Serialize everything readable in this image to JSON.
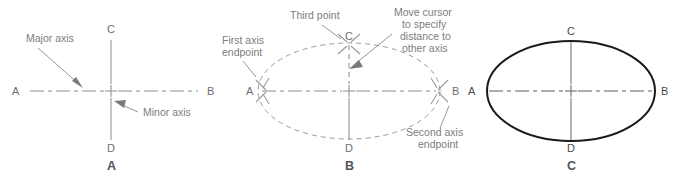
{
  "figure": {
    "background_color": "#ffffff",
    "annotation_color": "#7d7d80",
    "outline_color": "#1a1a1a"
  },
  "panels": [
    {
      "caption": "A",
      "description": "Major and minor axis centerlines",
      "point_labels": {
        "left": "A",
        "right": "B",
        "top": "C",
        "bottom": "D"
      },
      "annotations": [
        {
          "name": "major-axis",
          "lines": [
            "Major axis"
          ]
        },
        {
          "name": "minor-axis",
          "lines": [
            "Minor axis"
          ]
        }
      ]
    },
    {
      "caption": "B",
      "description": "Dashed preview ellipse with pick point prompts",
      "point_labels": {
        "left": "A",
        "right": "B",
        "top": "C",
        "bottom": "D"
      },
      "annotations": [
        {
          "name": "first-axis-endpoint",
          "lines": [
            "First axis",
            "endpoint"
          ]
        },
        {
          "name": "third-point",
          "lines": [
            "Third point"
          ]
        },
        {
          "name": "move-cursor",
          "lines": [
            "Move cursor",
            "to specify",
            "distance to",
            "other axis"
          ]
        },
        {
          "name": "second-axis-endpoint",
          "lines": [
            "Second axis",
            "endpoint"
          ]
        }
      ]
    },
    {
      "caption": "C",
      "description": "Completed ellipse with centerlines",
      "point_labels": {
        "left": "A",
        "right": "B",
        "top": "C",
        "bottom": "D"
      },
      "annotations": []
    }
  ]
}
